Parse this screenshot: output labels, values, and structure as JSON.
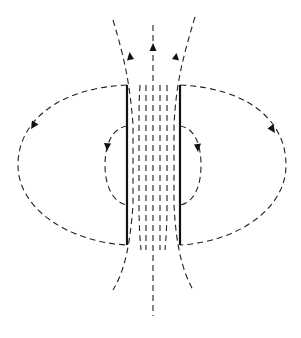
{
  "colors": {
    "background": "#ffffff",
    "lines": "#222222",
    "plates": "#111111"
  },
  "plates": [
    {
      "id": "left-plate",
      "x": 127,
      "y1": 85,
      "y2": 245
    },
    {
      "id": "right-plate",
      "x": 180,
      "y1": 85,
      "y2": 245
    }
  ],
  "field_lines": {
    "between_plates_count": 7,
    "outer_loops": 2,
    "inner_loops": 2,
    "fringe_top": 3,
    "fringe_bottom": 3
  },
  "arrows": [
    {
      "id": "arrow-top-center",
      "x": 153,
      "y": 48,
      "direction": "up"
    },
    {
      "id": "arrow-top-left",
      "x": 131,
      "y": 57,
      "direction": "up"
    },
    {
      "id": "arrow-top-right",
      "x": 175,
      "y": 58,
      "direction": "up"
    },
    {
      "id": "arrow-outer-left",
      "x": 35,
      "y": 124,
      "direction": "down-left"
    },
    {
      "id": "arrow-outer-right",
      "x": 271,
      "y": 128,
      "direction": "down-right"
    },
    {
      "id": "arrow-inner-left",
      "x": 108,
      "y": 146,
      "direction": "down"
    },
    {
      "id": "arrow-inner-right",
      "x": 197,
      "y": 147,
      "direction": "down"
    }
  ]
}
